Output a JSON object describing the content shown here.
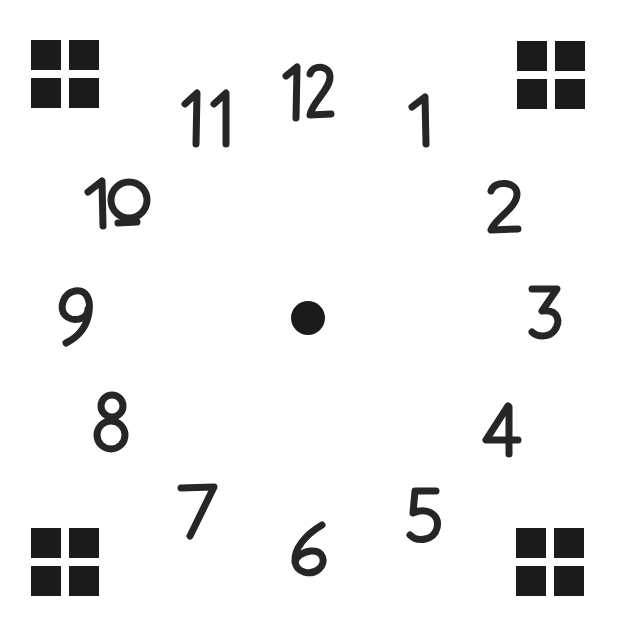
{
  "canvas": {
    "width": 619,
    "height": 629,
    "background_color": "#ffffff",
    "ink_color": "#262626",
    "marker_color": "#1b1b1b"
  },
  "clock": {
    "title": "Hand-drawn clock face",
    "center_dot": {
      "name": "center-dot",
      "x": 308,
      "y": 318,
      "radius": 17
    },
    "numerals": [
      {
        "label": "12",
        "x": 282,
        "y": 62,
        "w": 52,
        "h": 60
      },
      {
        "label": "1",
        "x": 408,
        "y": 92,
        "w": 30,
        "h": 56
      },
      {
        "label": "2",
        "x": 484,
        "y": 178,
        "w": 38,
        "h": 56
      },
      {
        "label": "3",
        "x": 527,
        "y": 284,
        "w": 36,
        "h": 56
      },
      {
        "label": "4",
        "x": 482,
        "y": 402,
        "w": 40,
        "h": 56
      },
      {
        "label": "5",
        "x": 406,
        "y": 486,
        "w": 36,
        "h": 58
      },
      {
        "label": "6",
        "x": 289,
        "y": 521,
        "w": 42,
        "h": 56
      },
      {
        "label": "7",
        "x": 177,
        "y": 482,
        "w": 42,
        "h": 58
      },
      {
        "label": "8",
        "x": 94,
        "y": 392,
        "w": 36,
        "h": 60
      },
      {
        "label": "9",
        "x": 58,
        "y": 285,
        "w": 38,
        "h": 62
      },
      {
        "label": "10",
        "x": 84,
        "y": 176,
        "w": 66,
        "h": 62
      },
      {
        "label": "11",
        "x": 181,
        "y": 88,
        "w": 54,
        "h": 60
      }
    ],
    "markers": [
      {
        "name": "marker-top-left",
        "x": 31,
        "y": 40,
        "squares": 4
      },
      {
        "name": "marker-top-right",
        "x": 517,
        "y": 41,
        "squares": 4
      },
      {
        "name": "marker-bottom-left",
        "x": 31,
        "y": 528,
        "squares": 4
      },
      {
        "name": "marker-bottom-right",
        "x": 516,
        "y": 528,
        "squares": 4
      }
    ]
  }
}
